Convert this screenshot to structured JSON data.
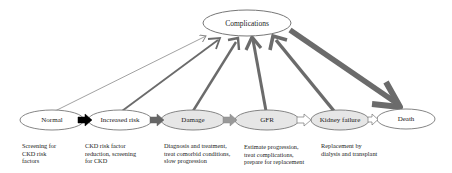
{
  "diagram": {
    "top_node": {
      "id": "complications",
      "label": "Complications"
    },
    "stages": [
      {
        "id": "normal",
        "label": "Normal",
        "fill": "#ffffff",
        "description": [
          "Screening for",
          "CKD risk",
          "factors"
        ]
      },
      {
        "id": "increased-risk",
        "label": "Increased risk",
        "fill": "#ffffff",
        "description": [
          "CKD risk factor",
          "reduction, screening",
          "for CKD"
        ]
      },
      {
        "id": "damage",
        "label": "Damage",
        "fill": "#e6e6e6",
        "description": [
          "Diagnosis and treatment,",
          "treat comorbid conditions,",
          "slow progression"
        ]
      },
      {
        "id": "gfr",
        "label": "GFR",
        "fill": "#e6e6e6",
        "description": [
          "Estimate progression,",
          "treat complications,",
          "prepare for replacement"
        ]
      },
      {
        "id": "kidney-failure",
        "label": "Kidney failure",
        "fill": "#e6e6e6",
        "description": [
          "Replacement by",
          "dialysis and transplant"
        ]
      },
      {
        "id": "death",
        "label": "Death",
        "fill": "#ffffff",
        "description": []
      }
    ],
    "stage_arrows": [
      {
        "from": "normal",
        "to": "increased-risk",
        "fill": "#000000"
      },
      {
        "from": "increased-risk",
        "to": "damage",
        "fill": "#666666"
      },
      {
        "from": "damage",
        "to": "gfr",
        "fill": "#999999"
      },
      {
        "from": "gfr",
        "to": "kidney-failure",
        "fill": "#ffffff"
      },
      {
        "from": "kidney-failure",
        "to": "death",
        "fill": "#ffffff"
      }
    ],
    "complication_arrows": [
      {
        "from": "normal",
        "to": "complications",
        "weight": "thin"
      },
      {
        "from": "increased-risk",
        "to": "complications",
        "weight": "medium"
      },
      {
        "from": "damage",
        "to": "complications",
        "weight": "medium"
      },
      {
        "from": "gfr",
        "to": "complications",
        "weight": "thick"
      },
      {
        "from": "kidney-failure",
        "to": "complications",
        "weight": "thick"
      },
      {
        "from": "complications",
        "to": "death",
        "weight": "heavy"
      }
    ],
    "colors": {
      "outline": "#777777",
      "arrow": "#6b6b6b",
      "stage_gray": "#e6e6e6"
    }
  }
}
